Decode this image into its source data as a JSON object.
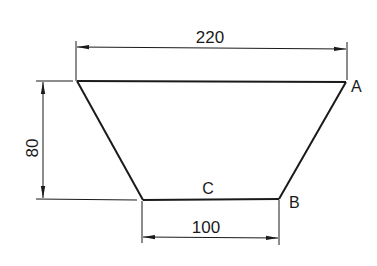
{
  "diagram": {
    "type": "technical-drawing",
    "shape": "trapezoid",
    "colors": {
      "background": "#ffffff",
      "stroke": "#1a1a1a"
    },
    "dimensions": {
      "top_width": "220",
      "bottom_width": "100",
      "height": "80"
    },
    "points": {
      "a": "A",
      "b": "B",
      "c": "C"
    }
  }
}
